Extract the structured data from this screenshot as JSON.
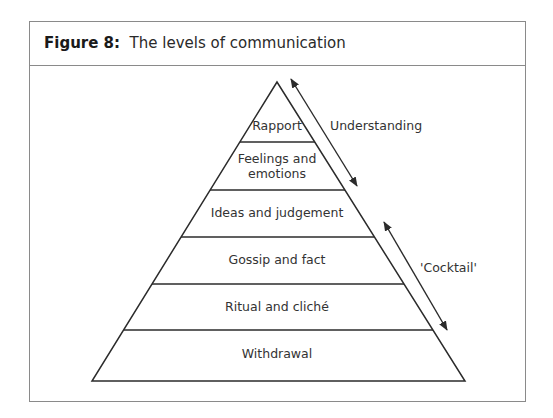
{
  "figure": {
    "label": "Figure 8:",
    "title": "The levels of communication"
  },
  "pyramid": {
    "levels": [
      {
        "label": "Rapport"
      },
      {
        "label_line1": "Feelings and",
        "label_line2": "emotions"
      },
      {
        "label": "Ideas and judgement"
      },
      {
        "label": "Gossip and fact"
      },
      {
        "label": "Ritual and cliché"
      },
      {
        "label": "Withdrawal"
      }
    ]
  },
  "annotations": {
    "understanding": "Understanding",
    "cocktail": "'Cocktail'"
  },
  "colors": {
    "line": "#2b2b2b",
    "frame": "#8a8a8a",
    "text": "#333333"
  }
}
